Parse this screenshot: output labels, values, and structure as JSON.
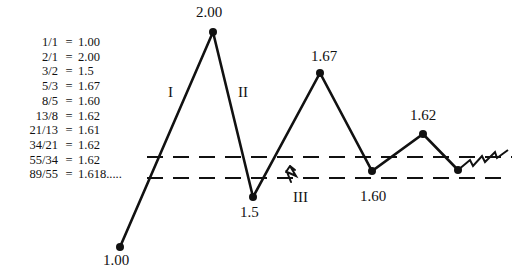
{
  "ratio_table": [
    {
      "fraction": "1/1",
      "equals": "=",
      "value": "1.00"
    },
    {
      "fraction": "2/1",
      "equals": "=",
      "value": "2.00"
    },
    {
      "fraction": "3/2",
      "equals": "=",
      "value": "1.5"
    },
    {
      "fraction": "5/3",
      "equals": "=",
      "value": "1.67"
    },
    {
      "fraction": "8/5",
      "equals": "=",
      "value": "1.60"
    },
    {
      "fraction": "13/8",
      "equals": "=",
      "value": "1.62"
    },
    {
      "fraction": "21/13",
      "equals": "=",
      "value": "1.61"
    },
    {
      "fraction": "34/21",
      "equals": "=",
      "value": "1.62"
    },
    {
      "fraction": "55/34",
      "equals": "=",
      "value": "1.62"
    },
    {
      "fraction": "89/55",
      "equals": "=",
      "value": "1.618....."
    }
  ],
  "diagram": {
    "points": [
      {
        "label": "1.00",
        "x": 120,
        "y": 247
      },
      {
        "label": "2.00",
        "x": 213,
        "y": 32
      },
      {
        "label": "1.5",
        "x": 253,
        "y": 197
      },
      {
        "label": "1.67",
        "x": 320,
        "y": 73
      },
      {
        "label": "1.60",
        "x": 372,
        "y": 171
      },
      {
        "label": "1.62",
        "x": 423,
        "y": 134
      },
      {
        "label": "",
        "x": 458,
        "y": 170
      }
    ],
    "wave_labels": [
      {
        "text": "I",
        "x": 168,
        "y": 84
      },
      {
        "text": "II",
        "x": 238,
        "y": 84
      },
      {
        "text": "III",
        "x": 293,
        "y": 189
      }
    ],
    "point_labels": [
      {
        "text": "1.00",
        "x": 103,
        "y": 252
      },
      {
        "text": "2.00",
        "x": 196,
        "y": 4
      },
      {
        "text": "1.5",
        "x": 240,
        "y": 204
      },
      {
        "text": "1.67",
        "x": 311,
        "y": 48
      },
      {
        "text": "1.60",
        "x": 360,
        "y": 188
      },
      {
        "text": "1.62",
        "x": 410,
        "y": 107
      }
    ],
    "dashed_lines": [
      {
        "name": "upper-convergence-line",
        "y": 157,
        "x1": 147,
        "x2": 512
      },
      {
        "name": "lower-convergence-line",
        "y": 178,
        "x1": 147,
        "x2": 502
      }
    ],
    "line_color": "#111111"
  }
}
